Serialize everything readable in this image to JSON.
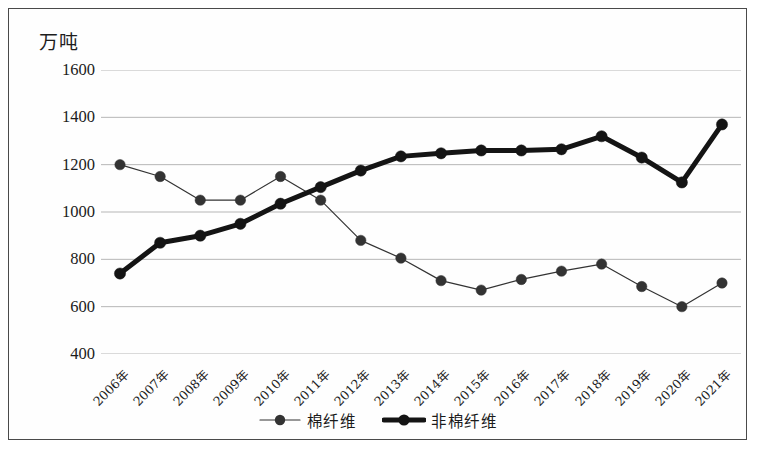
{
  "figure": {
    "unit_label": "万吨",
    "border_color": "#4a4a4a"
  },
  "legend": {
    "position": "bottom-center",
    "items": [
      {
        "label": "棉纤维",
        "style": "thin-line-with-round-marker",
        "color": "#333333"
      },
      {
        "label": "非棉纤维",
        "style": "thick-line-with-round-marker",
        "color": "#141414"
      }
    ]
  },
  "chart_data": {
    "type": "line",
    "title": "",
    "subtitle": "",
    "xlabel": "",
    "ylabel": "万吨",
    "grid": true,
    "gridlines_y": [
      400,
      600,
      800,
      1000,
      1200,
      1400,
      1600
    ],
    "ylim": [
      400,
      1600
    ],
    "ytick_labels": [
      "1600",
      "1400",
      "1200",
      "1000",
      "800",
      "600",
      "400"
    ],
    "categories": [
      "2006年",
      "2007年",
      "2008年",
      "2009年",
      "2010年",
      "2011年",
      "2012年",
      "2013年",
      "2014年",
      "2015年",
      "2016年",
      "2017年",
      "2018年",
      "2019年",
      "2020年",
      "2021年"
    ],
    "series": [
      {
        "name": "棉纤维",
        "color": "#333333",
        "line_width": 1.2,
        "marker_size": 5.2,
        "values": [
          1200,
          1150,
          1050,
          1050,
          1150,
          1050,
          880,
          805,
          710,
          670,
          715,
          750,
          780,
          685,
          600,
          700
        ]
      },
      {
        "name": "非棉纤维",
        "color": "#141414",
        "line_width": 5.0,
        "marker_size": 5.6,
        "values": [
          740,
          870,
          900,
          950,
          1035,
          1105,
          1175,
          1235,
          1248,
          1260,
          1260,
          1265,
          1320,
          1230,
          1125,
          1370
        ]
      }
    ]
  }
}
